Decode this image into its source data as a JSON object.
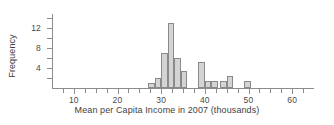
{
  "chart_data": {
    "type": "bar",
    "title": "",
    "subtitle": "",
    "xlabel": "Mean per Capita Income in 2007 (thousands)",
    "ylabel": "Frequency",
    "xlim": [
      5,
      65
    ],
    "ylim": [
      0,
      14.8
    ],
    "grid": false,
    "legend": null,
    "bin_width": 1.5,
    "x_ticks": [
      10,
      20,
      30,
      40,
      50,
      60
    ],
    "x_tick_labels": [
      "10",
      "20",
      "30",
      "40",
      "50",
      "60"
    ],
    "x_minor_ticks": [
      7.5,
      12.5,
      15,
      17.5,
      22.5,
      25,
      27.5,
      32.5,
      35,
      37.5,
      42.5,
      45,
      47.5,
      52.5,
      55,
      57.5,
      62.5
    ],
    "y_ticks": [
      4,
      8,
      12
    ],
    "y_tick_labels": [
      "4",
      "8",
      "12"
    ],
    "y_minor_ticks": [
      2,
      6,
      10,
      14
    ],
    "bin_edges": [
      27,
      28.5,
      30,
      31.5,
      33,
      34.5,
      36,
      37.5,
      39,
      40.5,
      42,
      43.5,
      45,
      46.5,
      48,
      49.5,
      51,
      52.5,
      54,
      55.5
    ],
    "bin_centers": [
      27.75,
      29.25,
      30.75,
      32.25,
      33.75,
      35.25,
      36.75,
      38.25,
      39.75,
      41.25,
      42.75,
      44.25,
      45.75,
      47.25,
      48.75,
      50.25,
      51.75,
      53.25,
      54.75
    ],
    "values": [
      1,
      2,
      7,
      13,
      6,
      3.5,
      0,
      0,
      5.3,
      1.5,
      1.5,
      1.5,
      1.5,
      2.5,
      0,
      0,
      1.5
    ],
    "bars": [
      {
        "x0": 27.0,
        "x1": 28.5,
        "height": 1
      },
      {
        "x0": 28.5,
        "x1": 30.0,
        "height": 2
      },
      {
        "x0": 30.0,
        "x1": 31.5,
        "height": 7
      },
      {
        "x0": 31.5,
        "x1": 33.0,
        "height": 13
      },
      {
        "x0": 33.0,
        "x1": 34.5,
        "height": 6
      },
      {
        "x0": 34.5,
        "x1": 36.0,
        "height": 3.5
      },
      {
        "x0": 38.5,
        "x1": 40.0,
        "height": 5.3
      },
      {
        "x0": 40.0,
        "x1": 41.5,
        "height": 1.5
      },
      {
        "x0": 41.5,
        "x1": 43.0,
        "height": 1.5
      },
      {
        "x0": 43.5,
        "x1": 45.0,
        "height": 1.5
      },
      {
        "x0": 45.0,
        "x1": 46.5,
        "height": 2.5
      },
      {
        "x0": 49.0,
        "x1": 50.5,
        "height": 1.5
      }
    ],
    "bar_fill": "#d4d4d4",
    "bar_stroke": "#8a8a8a",
    "axis_color": "#8c8c8c",
    "text_color": "#3f3f3f"
  }
}
